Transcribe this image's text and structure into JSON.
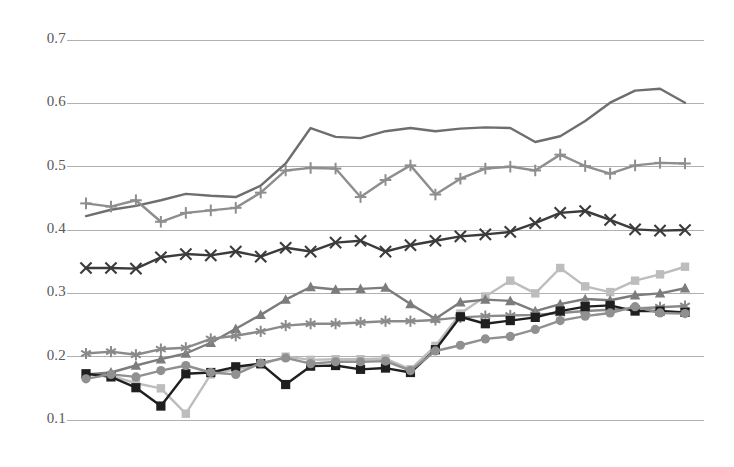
{
  "chart_data": {
    "type": "line",
    "title": "",
    "subtitle": "",
    "xlabel": "",
    "ylabel": "",
    "ylim": [
      0.1,
      0.7
    ],
    "xlim": [
      1,
      25
    ],
    "yticks": [
      0.7,
      0.6,
      0.5,
      0.4,
      0.3,
      0.2,
      0.1
    ],
    "ytick_labels": [
      "0.7",
      "0.6",
      "0.5",
      "0.4",
      "0.3",
      "0.2",
      "0.1"
    ],
    "xticks": [],
    "xtick_labels": [],
    "grid": {
      "horizontal": true,
      "vertical": false,
      "color": "#b0b0b0"
    },
    "legend": {
      "visible": false,
      "position": "none"
    },
    "annotations": [],
    "x": [
      1,
      2,
      3,
      4,
      5,
      6,
      7,
      8,
      9,
      10,
      11,
      12,
      13,
      14,
      15,
      16,
      17,
      18,
      19,
      20,
      21,
      22,
      23,
      24,
      25
    ],
    "series": [
      {
        "name": "series-1-plain-line",
        "marker": "none",
        "color": "#6e6e6e",
        "width": 2.4,
        "values": [
          0.422,
          0.432,
          0.438,
          0.447,
          0.457,
          0.454,
          0.452,
          0.47,
          0.505,
          0.561,
          0.547,
          0.545,
          0.556,
          0.561,
          0.556,
          0.56,
          0.562,
          0.561,
          0.539,
          0.548,
          0.572,
          0.601,
          0.62,
          0.623,
          0.601
        ]
      },
      {
        "name": "series-2-plus-markers",
        "marker": "plus",
        "color": "#8e8e8e",
        "width": 2.4,
        "values": [
          0.442,
          0.437,
          0.447,
          0.413,
          0.427,
          0.431,
          0.435,
          0.459,
          0.494,
          0.498,
          0.497,
          0.452,
          0.479,
          0.502,
          0.456,
          0.481,
          0.497,
          0.5,
          0.494,
          0.519,
          0.501,
          0.489,
          0.502,
          0.506,
          0.505
        ]
      },
      {
        "name": "series-3-x-markers",
        "marker": "x",
        "color": "#3b3b3b",
        "width": 2.4,
        "values": [
          0.34,
          0.34,
          0.339,
          0.357,
          0.362,
          0.36,
          0.366,
          0.358,
          0.372,
          0.366,
          0.38,
          0.383,
          0.366,
          0.376,
          0.383,
          0.39,
          0.393,
          0.397,
          0.411,
          0.427,
          0.43,
          0.416,
          0.401,
          0.399,
          0.4
        ]
      },
      {
        "name": "series-4-light-line",
        "marker": "square-small",
        "color": "#bdbdbd",
        "width": 2.4,
        "values": [
          0.173,
          0.17,
          0.158,
          0.15,
          0.11,
          0.172,
          0.18,
          0.187,
          0.2,
          0.195,
          0.196,
          0.196,
          0.197,
          0.18,
          0.217,
          0.268,
          0.295,
          0.32,
          0.3,
          0.34,
          0.311,
          0.302,
          0.32,
          0.33,
          0.342
        ]
      },
      {
        "name": "series-5-triangle-markers",
        "marker": "triangle",
        "color": "#7c7c7c",
        "width": 2.4,
        "values": [
          0.172,
          0.175,
          0.186,
          0.196,
          0.205,
          0.222,
          0.244,
          0.266,
          0.29,
          0.31,
          0.306,
          0.307,
          0.309,
          0.283,
          0.26,
          0.286,
          0.29,
          0.288,
          0.272,
          0.283,
          0.291,
          0.289,
          0.297,
          0.3,
          0.308
        ]
      },
      {
        "name": "series-6-asterisk-markers",
        "marker": "asterisk",
        "color": "#8a8a8a",
        "width": 2.4,
        "values": [
          0.205,
          0.208,
          0.203,
          0.212,
          0.214,
          0.228,
          0.233,
          0.24,
          0.249,
          0.252,
          0.252,
          0.254,
          0.256,
          0.256,
          0.258,
          0.262,
          0.264,
          0.265,
          0.266,
          0.269,
          0.272,
          0.274,
          0.276,
          0.278,
          0.28
        ]
      },
      {
        "name": "series-7-square-markers",
        "marker": "square",
        "color": "#1f1f1f",
        "width": 2.4,
        "values": [
          0.173,
          0.168,
          0.151,
          0.122,
          0.173,
          0.175,
          0.184,
          0.189,
          0.156,
          0.185,
          0.186,
          0.18,
          0.182,
          0.175,
          0.211,
          0.263,
          0.252,
          0.257,
          0.262,
          0.272,
          0.279,
          0.281,
          0.272,
          0.272,
          0.27
        ]
      },
      {
        "name": "series-8-circle-markers",
        "marker": "circle",
        "color": "#909090",
        "width": 2.4,
        "values": [
          0.165,
          0.172,
          0.168,
          0.178,
          0.186,
          0.175,
          0.172,
          0.19,
          0.198,
          0.189,
          0.192,
          0.192,
          0.193,
          0.178,
          0.209,
          0.218,
          0.228,
          0.232,
          0.243,
          0.257,
          0.264,
          0.269,
          0.279,
          0.269,
          0.268
        ]
      }
    ]
  },
  "axis": {
    "left_label_x": 22,
    "plot_left": 67,
    "plot_right": 704,
    "plot_top": 40,
    "plot_bottom": 420
  },
  "colors": {
    "background": "#ffffff",
    "gridline": "#b0b0b0",
    "tick_text": "#595959"
  }
}
